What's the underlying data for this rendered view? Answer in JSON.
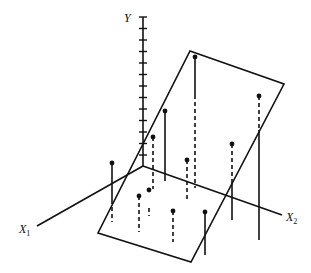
{
  "diagram": {
    "type": "3d-regression-plane",
    "colors": {
      "ink": "#111111",
      "background": "#ffffff"
    },
    "axes": {
      "origin": [
        143,
        166
      ],
      "y": {
        "label": "Y",
        "top": [
          143,
          17
        ],
        "tick_count": 13,
        "tick_spacing": 11.5
      },
      "x1": {
        "label": "X",
        "subscript": "1",
        "end": [
          37,
          226
        ]
      },
      "x2": {
        "label": "X",
        "subscript": "2",
        "end": [
          282,
          215
        ]
      }
    },
    "plane": {
      "corners": [
        [
          190,
          51
        ],
        [
          284,
          84
        ],
        [
          191,
          262
        ],
        [
          98,
          233
        ]
      ]
    },
    "points": [
      {
        "id": "A",
        "dot": [
          195,
          57
        ],
        "segments": [
          {
            "style": "solid",
            "from": 57,
            "to": 95
          },
          {
            "style": "dashed",
            "from": 95,
            "to": 188
          }
        ]
      },
      {
        "id": "B",
        "dot": [
          259,
          96
        ],
        "segments": [
          {
            "style": "dashed",
            "from": 96,
            "to": 130
          },
          {
            "style": "solid",
            "from": 130,
            "to": 240
          }
        ]
      },
      {
        "id": "C",
        "dot": [
          165,
          111
        ],
        "segments": [
          {
            "style": "solid",
            "from": 111,
            "to": 181
          }
        ]
      },
      {
        "id": "D",
        "dot": [
          153,
          137
        ],
        "segments": [
          {
            "style": "dashed",
            "from": 137,
            "to": 189
          }
        ]
      },
      {
        "id": "E",
        "dot": [
          187,
          160
        ],
        "segments": [
          {
            "style": "dashed",
            "from": 160,
            "to": 200
          }
        ]
      },
      {
        "id": "F",
        "dot": [
          232,
          144
        ],
        "segments": [
          {
            "style": "dashed",
            "from": 144,
            "to": 180
          },
          {
            "style": "solid",
            "from": 180,
            "to": 220
          }
        ]
      },
      {
        "id": "G",
        "dot": [
          112,
          163
        ],
        "segments": [
          {
            "style": "solid",
            "from": 163,
            "to": 200
          },
          {
            "style": "dashed",
            "from": 200,
            "to": 222
          }
        ]
      },
      {
        "id": "H",
        "dot": [
          139,
          196
        ],
        "segments": [
          {
            "style": "dashed",
            "from": 196,
            "to": 232
          }
        ]
      },
      {
        "id": "I",
        "dot": [
          149,
          190
        ],
        "segments": [
          {
            "style": "dashed",
            "from": 208,
            "to": 216
          }
        ]
      },
      {
        "id": "J",
        "dot": [
          173,
          211
        ],
        "segments": [
          {
            "style": "dashed",
            "from": 211,
            "to": 242
          }
        ]
      },
      {
        "id": "K",
        "dot": [
          205,
          212
        ],
        "segments": [
          {
            "style": "solid",
            "from": 212,
            "to": 255
          }
        ]
      }
    ]
  }
}
